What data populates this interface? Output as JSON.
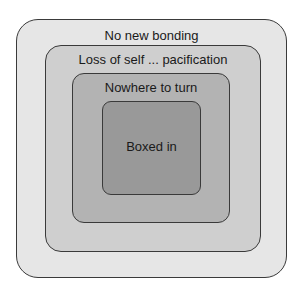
{
  "diagram": {
    "type": "nested-boxes",
    "layers": [
      {
        "label": "No new bonding",
        "fill": "#e6e6e6"
      },
      {
        "label": "Loss of self ... pacification",
        "fill": "#cfcfcf"
      },
      {
        "label": "Nowhere to turn",
        "fill": "#b3b3b3"
      },
      {
        "label": "Boxed in",
        "fill": "#999999"
      }
    ]
  }
}
